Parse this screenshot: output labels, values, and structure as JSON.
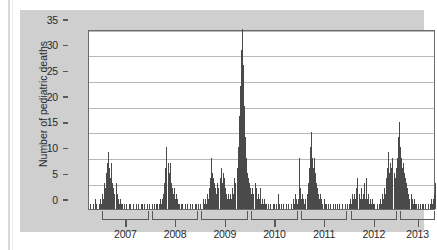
{
  "figure": {
    "background_color": "#cfcfcf",
    "plot_background_color": "#ffffff",
    "bar_color": "#4a4a4a",
    "axis_color": "#5a5a5a",
    "grid_color": "#b8b8b8"
  },
  "chart_data": {
    "type": "bar",
    "title": "",
    "subtitle": "",
    "xlabel": "",
    "ylabel": "Number of pediatric deaths",
    "ylim": [
      0,
      35
    ],
    "yticks": [
      0,
      5,
      10,
      15,
      20,
      25,
      30,
      35
    ],
    "ytick_labels": [
      "0",
      "5",
      "10",
      "15",
      "20",
      "25",
      "30",
      "35"
    ],
    "grid": true,
    "grid_axis": "y",
    "legend": false,
    "legend_position": "none",
    "xlim": [
      "2006-09",
      "2013-10"
    ],
    "x_axis_style": "bracketed-year-segments",
    "xtick_labels": [
      "2007",
      "2008",
      "2009",
      "2010",
      "2011",
      "2012",
      "2013"
    ],
    "x_segment_labels": [
      "2007",
      "2008",
      "2009",
      "2010",
      "2011",
      "2012",
      "2013"
    ],
    "x_unit": "week",
    "series": [
      {
        "name": "Weekly pediatric influenza deaths",
        "values": [
          0,
          1,
          0,
          0,
          1,
          0,
          2,
          1,
          0,
          1,
          2,
          1,
          3,
          2,
          5,
          4,
          7,
          9,
          11,
          8,
          6,
          9,
          5,
          4,
          3,
          5,
          3,
          2,
          1,
          2,
          1,
          1,
          0,
          1,
          0,
          1,
          0,
          0,
          1,
          1,
          0,
          1,
          0,
          0,
          1,
          0,
          1,
          0,
          0,
          1,
          1,
          0,
          1,
          0,
          0,
          1,
          0,
          1,
          0,
          1,
          0,
          1,
          0,
          1,
          1,
          0,
          1,
          2,
          1,
          2,
          3,
          5,
          8,
          12,
          9,
          7,
          9,
          5,
          4,
          3,
          4,
          2,
          3,
          2,
          1,
          1,
          0,
          1,
          1,
          0,
          1,
          0,
          1,
          0,
          0,
          1,
          0,
          1,
          0,
          0,
          1,
          1,
          0,
          1,
          0,
          1,
          0,
          2,
          1,
          2,
          1,
          3,
          2,
          4,
          6,
          10,
          7,
          6,
          5,
          4,
          3,
          5,
          4,
          6,
          8,
          5,
          7,
          6,
          4,
          3,
          2,
          3,
          2,
          3,
          2,
          4,
          3,
          6,
          5,
          8,
          12,
          18,
          24,
          31,
          35,
          28,
          20,
          14,
          10,
          7,
          6,
          5,
          4,
          3,
          4,
          3,
          5,
          4,
          2,
          3,
          2,
          4,
          1,
          2,
          1,
          2,
          1,
          1,
          0,
          1,
          0,
          1,
          0,
          1,
          1,
          0,
          1,
          0,
          3,
          1,
          0,
          1,
          0,
          1,
          0,
          0,
          1,
          0,
          1,
          0,
          1,
          0,
          2,
          1,
          3,
          2,
          1,
          2,
          10,
          4,
          2,
          3,
          2,
          1,
          2,
          3,
          5,
          8,
          12,
          15,
          10,
          8,
          10,
          7,
          5,
          4,
          3,
          2,
          3,
          2,
          1,
          2,
          1,
          1,
          0,
          1,
          0,
          1,
          0,
          0,
          1,
          0,
          1,
          0,
          1,
          0,
          1,
          0,
          1,
          0,
          0,
          1,
          0,
          1,
          0,
          1,
          2,
          1,
          3,
          2,
          3,
          2,
          4,
          6,
          3,
          2,
          4,
          2,
          3,
          5,
          2,
          6,
          2,
          3,
          1,
          2,
          1,
          2,
          1,
          1,
          0,
          1,
          0,
          1,
          2,
          1,
          3,
          2,
          4,
          3,
          6,
          8,
          11,
          7,
          9,
          8,
          10,
          7,
          6,
          8,
          10,
          14,
          17,
          12,
          10,
          8,
          9,
          7,
          6,
          5,
          4,
          3,
          2,
          3,
          2,
          1,
          2,
          1,
          1,
          0,
          1,
          0,
          1,
          0,
          1,
          1,
          0,
          1,
          0,
          1,
          0,
          1,
          2,
          1,
          2,
          3,
          5
        ]
      }
    ],
    "peaks": [
      {
        "label": "2006-07 season peak",
        "value": 11
      },
      {
        "label": "2007-08 season peak",
        "value": 12
      },
      {
        "label": "2008-09 pre-pandemic peak",
        "value": 10
      },
      {
        "label": "2009 H1N1 pandemic peak",
        "value": 35
      },
      {
        "label": "2010-11 season peak",
        "value": 15
      },
      {
        "label": "2011-12 season peak",
        "value": 6
      },
      {
        "label": "2012-13 season peak",
        "value": 17
      }
    ]
  }
}
